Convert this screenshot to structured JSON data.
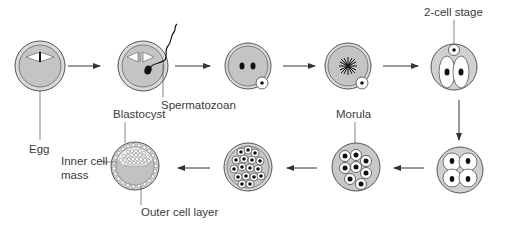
{
  "diagram": {
    "colors": {
      "cytoplasm": "#c8c8c8",
      "membrane": "#d6d6d6",
      "outline": "#555555",
      "nucleus": "#111111",
      "cell_fill": "#ffffff",
      "arrow": "#333333"
    },
    "stages": [
      {
        "id": "egg",
        "label": "Egg"
      },
      {
        "id": "fertilization",
        "label": "Spermatozoan"
      },
      {
        "id": "pronuclei",
        "label": ""
      },
      {
        "id": "fusion",
        "label": ""
      },
      {
        "id": "two-cell",
        "label": "2-cell stage"
      },
      {
        "id": "four-cell",
        "label": ""
      },
      {
        "id": "morula",
        "label": "Morula"
      },
      {
        "id": "sixteen-cell",
        "label": ""
      },
      {
        "id": "blastocyst",
        "label": "Blastocyst"
      }
    ],
    "labels": {
      "egg": "Egg",
      "spermatozoan": "Spermatozoan",
      "two_cell": "2-cell stage",
      "morula": "Morula",
      "blastocyst": "Blastocyst",
      "inner_cell_mass_line1": "Inner cell",
      "inner_cell_mass_line2": "mass",
      "outer_cell_layer": "Outer cell layer"
    },
    "flow": [
      "egg",
      "fertilization",
      "pronuclei",
      "fusion",
      "two-cell",
      "four-cell",
      "morula",
      "sixteen-cell",
      "blastocyst"
    ]
  }
}
